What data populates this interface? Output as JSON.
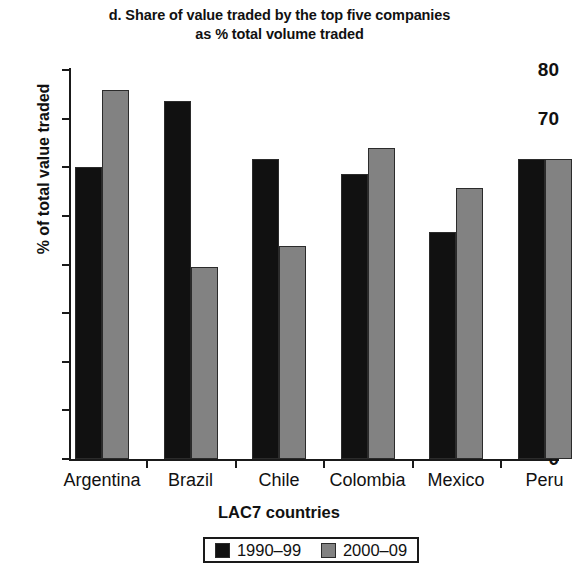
{
  "chart_data": {
    "type": "bar",
    "title": "d. Share of value traded by the top five companies as % total volume traded",
    "title_line1": "d. Share of value traded by the top five companies",
    "title_line2": "as % total volume traded",
    "xlabel": "LAC7 countries",
    "ylabel": "% of total value traded",
    "categories": [
      "Argentina",
      "Brazil",
      "Chile",
      "Colombia",
      "Mexico",
      "Peru"
    ],
    "series": [
      {
        "name": "1990–99",
        "color": "#111111",
        "values": [
          60.1,
          73.7,
          61.6,
          58.7,
          46.7,
          61.8
        ]
      },
      {
        "name": "2000–09",
        "color": "#828282",
        "values": [
          75.9,
          39.5,
          43.9,
          64.0,
          55.7,
          61.7
        ]
      }
    ],
    "ylim": [
      0,
      80
    ],
    "ytick_values": [
      0,
      10,
      20,
      30,
      40,
      50,
      60,
      70,
      80
    ],
    "ytick_labels": [
      "0",
      "10",
      "20",
      "30",
      "40",
      "50",
      "60",
      "70",
      "80"
    ],
    "grid": false,
    "legend_position": "bottom-center"
  }
}
